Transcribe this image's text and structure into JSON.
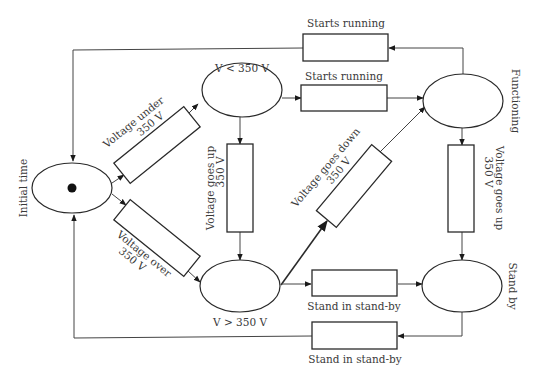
{
  "diagram": {
    "type": "petri-net",
    "places": [
      {
        "id": "initial",
        "label": "Initial time",
        "token": true
      },
      {
        "id": "v_under",
        "label": "V < 350 V",
        "token": false
      },
      {
        "id": "v_over",
        "label": "V > 350 V",
        "token": false
      },
      {
        "id": "functioning",
        "label": "Functioning",
        "token": false
      },
      {
        "id": "standby",
        "label": "Stand by",
        "token": false
      }
    ],
    "transitions": [
      {
        "id": "t_top",
        "label": "Starts running"
      },
      {
        "id": "t_mid",
        "label": "Starts running"
      },
      {
        "id": "t_under",
        "label_line1": "Voltage under",
        "label_line2": "350 V"
      },
      {
        "id": "t_over",
        "label_line1": "Voltage over",
        "label_line2": "350 V"
      },
      {
        "id": "t_up_left",
        "label_line1": "Voltage goes up",
        "label_line2": "350 V"
      },
      {
        "id": "t_down",
        "label_line1": "Voltage goes down",
        "label_line2": "350 V"
      },
      {
        "id": "t_up_right",
        "label_line1": "Voltage goes up",
        "label_line2": "350 V"
      },
      {
        "id": "t_stand1",
        "label": "Stand in stand-by"
      },
      {
        "id": "t_stand2",
        "label": "Stand in stand-by"
      }
    ],
    "arcs": [
      {
        "from": "initial",
        "to": "t_under"
      },
      {
        "from": "t_under",
        "to": "v_under"
      },
      {
        "from": "initial",
        "to": "t_over"
      },
      {
        "from": "t_over",
        "to": "v_over"
      },
      {
        "from": "v_under",
        "to": "t_mid"
      },
      {
        "from": "t_mid",
        "to": "functioning"
      },
      {
        "from": "v_under",
        "to": "t_up_left"
      },
      {
        "from": "t_up_left",
        "to": "v_over"
      },
      {
        "from": "v_over",
        "to": "t_down"
      },
      {
        "from": "t_down",
        "to": "functioning"
      },
      {
        "from": "v_over",
        "to": "t_stand1"
      },
      {
        "from": "t_stand1",
        "to": "standby"
      },
      {
        "from": "functioning",
        "to": "t_up_right"
      },
      {
        "from": "t_up_right",
        "to": "standby"
      },
      {
        "from": "functioning",
        "to": "t_top"
      },
      {
        "from": "t_top",
        "to": "initial"
      },
      {
        "from": "standby",
        "to": "t_stand2"
      },
      {
        "from": "t_stand2",
        "to": "initial"
      }
    ]
  }
}
